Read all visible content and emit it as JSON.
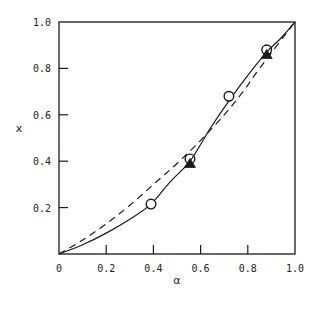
{
  "chart_data": {
    "type": "line",
    "title": "",
    "xlabel": "α",
    "ylabel": "x",
    "xlim": [
      0,
      1.0
    ],
    "ylim": [
      0,
      1.0
    ],
    "grid": false,
    "legend": null,
    "x_ticks": [
      "0",
      "0.2",
      "0.4",
      "0.6",
      "0.8",
      "1.0"
    ],
    "y_ticks": [
      "0.2",
      "0.4",
      "0.6",
      "0.8",
      "1.0"
    ],
    "series": [
      {
        "name": "solid curve",
        "style": "solid",
        "x": [
          0,
          0.1,
          0.2,
          0.3,
          0.39,
          0.47,
          0.555,
          0.64,
          0.72,
          0.8,
          0.88,
          0.94,
          1.0
        ],
        "y": [
          0,
          0.04,
          0.09,
          0.15,
          0.215,
          0.31,
          0.4,
          0.54,
          0.66,
          0.77,
          0.87,
          0.93,
          1.0
        ]
      },
      {
        "name": "dashed curve",
        "style": "dashed",
        "x": [
          0,
          0.1,
          0.2,
          0.3,
          0.4,
          0.5,
          0.6,
          0.7,
          0.78,
          0.85,
          1.0
        ],
        "y": [
          0,
          0.06,
          0.13,
          0.21,
          0.3,
          0.39,
          0.49,
          0.6,
          0.7,
          0.8,
          1.0
        ]
      },
      {
        "name": "open circles",
        "style": "marker-circle",
        "x": [
          0.39,
          0.555,
          0.72,
          0.88
        ],
        "y": [
          0.215,
          0.41,
          0.68,
          0.88
        ]
      },
      {
        "name": "filled triangles",
        "style": "marker-triangle",
        "x": [
          0.555,
          0.88
        ],
        "y": [
          0.39,
          0.86
        ]
      }
    ]
  },
  "axes": {
    "x_label": "α",
    "y_label": "x",
    "x_tick_labels": [
      "0",
      "0.2",
      "0.4",
      "0.6",
      "0.8",
      "1.0"
    ],
    "y_tick_labels": [
      "0.2",
      "0.4",
      "0.6",
      "0.8",
      "1.0"
    ]
  }
}
